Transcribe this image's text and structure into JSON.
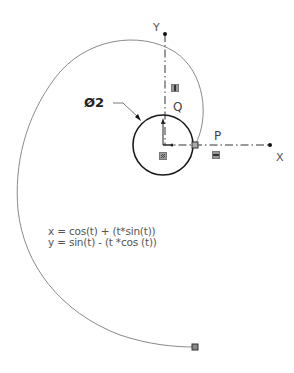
{
  "diagram": {
    "type": "sketch-involute-curve",
    "axes": {
      "x_label": "X",
      "y_label": "Y"
    },
    "points": {
      "p_label": "P",
      "q_label": "Q"
    },
    "dimension": {
      "label": "Ø2"
    },
    "equations": {
      "x_eq": "x = cos(t) + (t*sin(t))",
      "y_eq": "y = sin(t) - (t *cos (t))"
    },
    "colors": {
      "curve": "#8a8a8a",
      "circle": "#1a1a1a",
      "axis": "#333333",
      "relation_icon": "#9a9a9a"
    },
    "relations": [
      {
        "name": "vertical-relation",
        "symbol": "|"
      },
      {
        "name": "horizontal-relation",
        "symbol": "—"
      },
      {
        "name": "fixed-relation",
        "symbol": "fix"
      }
    ]
  }
}
